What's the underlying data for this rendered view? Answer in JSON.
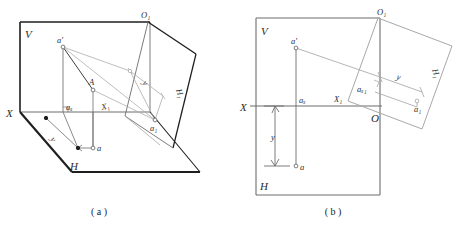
{
  "figure": {
    "title_a_caption": "( a )",
    "title_b_caption": "( b )"
  },
  "diagram_a": {
    "name": "pictorial-projection-view",
    "labels": {
      "v_plane": "V",
      "h_plane": "H",
      "h1_plane": "H₁",
      "x_axis": "X",
      "x1_axis": "X₁",
      "o1_origin": "O₁",
      "point_a_prime": "a'",
      "point_A": "A",
      "point_a": "a",
      "point_ax": "aₓ",
      "point_a1": "a₁",
      "dim_y_left": "y",
      "dim_y_right": "y"
    }
  },
  "diagram_b": {
    "name": "orthographic-projection-view",
    "labels": {
      "v_plane": "V",
      "h_plane": "H",
      "h1_plane": "H₁",
      "x_axis": "X",
      "x1_axis": "X₁",
      "o_origin": "O",
      "o1_origin": "O₁",
      "point_a_prime": "a'",
      "point_a": "a",
      "point_ax": "aₓ",
      "point_ax1": "aₓ₁",
      "point_a1": "a₁",
      "dim_y_left": "y",
      "dim_y_right": "y"
    }
  },
  "colors": {
    "line_hard": "#1e1e1e",
    "line_mid": "#6d6d6d",
    "line_soft": "#a8a8a8",
    "line_very_soft": "#bdbdbd",
    "text": "#2b2b2b",
    "background": "#ffffff"
  }
}
